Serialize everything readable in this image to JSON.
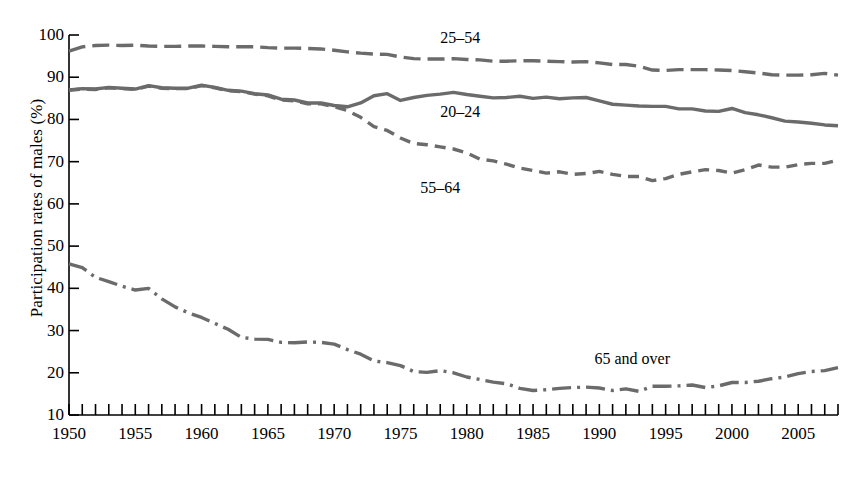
{
  "chart_data": {
    "type": "line",
    "title": "",
    "xlabel": "",
    "ylabel": "Participation rates of males (%)",
    "xlim": [
      1950,
      2008
    ],
    "ylim": [
      10,
      100
    ],
    "yticks": [
      10,
      20,
      30,
      40,
      50,
      60,
      70,
      80,
      90,
      100
    ],
    "xticks_labeled": [
      1950,
      1955,
      1960,
      1965,
      1970,
      1975,
      1980,
      1985,
      1990,
      1995,
      2000,
      2005
    ],
    "xtick_interval": 1,
    "grid": false,
    "legend_position": "inline-annotations",
    "line_color": "#6b6b6b",
    "axis_color": "#000000",
    "x": [
      1950,
      1951,
      1952,
      1953,
      1954,
      1955,
      1956,
      1957,
      1958,
      1959,
      1960,
      1961,
      1962,
      1963,
      1964,
      1965,
      1966,
      1967,
      1968,
      1969,
      1970,
      1971,
      1972,
      1973,
      1974,
      1975,
      1976,
      1977,
      1978,
      1979,
      1980,
      1981,
      1982,
      1983,
      1984,
      1985,
      1986,
      1987,
      1988,
      1989,
      1990,
      1991,
      1992,
      1993,
      1994,
      1995,
      1996,
      1997,
      1998,
      1999,
      2000,
      2001,
      2002,
      2003,
      2004,
      2005,
      2006,
      2007,
      2008
    ],
    "series": [
      {
        "name": "25-54",
        "label": "25–54",
        "dash": "long-dash",
        "label_x": 1979.5,
        "label_y": 99.0,
        "values": [
          96.2,
          97.2,
          97.5,
          97.6,
          97.5,
          97.6,
          97.4,
          97.3,
          97.3,
          97.4,
          97.4,
          97.3,
          97.2,
          97.2,
          97.2,
          97.0,
          96.9,
          96.9,
          96.8,
          96.7,
          96.4,
          96.0,
          95.7,
          95.5,
          95.4,
          94.8,
          94.4,
          94.3,
          94.3,
          94.4,
          94.2,
          94.1,
          93.8,
          93.8,
          93.9,
          93.9,
          93.8,
          93.7,
          93.6,
          93.7,
          93.4,
          93.0,
          93.0,
          92.6,
          91.7,
          91.6,
          91.8,
          91.8,
          91.8,
          91.7,
          91.6,
          91.3,
          91.0,
          90.6,
          90.5,
          90.5,
          90.6,
          90.9,
          90.5
        ]
      },
      {
        "name": "20-24",
        "label": "20–24",
        "dash": "solid",
        "label_x": 1979.5,
        "label_y": 81.5,
        "values": [
          87.0,
          87.3,
          87.2,
          87.6,
          87.4,
          87.2,
          88.0,
          87.5,
          87.4,
          87.4,
          88.1,
          87.6,
          86.9,
          86.7,
          86.1,
          85.8,
          84.8,
          84.6,
          83.9,
          83.9,
          83.3,
          83.0,
          83.9,
          85.6,
          86.1,
          84.5,
          85.2,
          85.7,
          86.0,
          86.4,
          85.9,
          85.5,
          85.1,
          85.2,
          85.5,
          85.0,
          85.3,
          84.9,
          85.1,
          85.2,
          84.4,
          83.6,
          83.4,
          83.2,
          83.1,
          83.1,
          82.5,
          82.5,
          82.0,
          81.9,
          82.6,
          81.6,
          81.1,
          80.4,
          79.6,
          79.4,
          79.1,
          78.7,
          78.5
        ]
      },
      {
        "name": "55-64",
        "label": "55–64",
        "dash": "short-dash",
        "label_x": 1978.0,
        "label_y": 63.5,
        "values": [
          86.9,
          87.2,
          87.1,
          87.5,
          87.3,
          87.1,
          87.9,
          87.4,
          87.3,
          87.3,
          88.0,
          87.5,
          86.8,
          86.6,
          86.0,
          85.6,
          84.6,
          84.4,
          83.7,
          83.7,
          83.0,
          82.1,
          80.5,
          78.3,
          77.4,
          75.6,
          74.3,
          74.0,
          73.5,
          73.0,
          72.1,
          70.6,
          70.2,
          69.4,
          68.5,
          67.9,
          67.3,
          67.6,
          67.0,
          67.2,
          67.7,
          67.0,
          66.5,
          66.5,
          65.5,
          66.0,
          67.0,
          67.6,
          68.1,
          67.9,
          67.3,
          68.1,
          69.2,
          68.7,
          68.7,
          69.3,
          69.6,
          69.6,
          70.4
        ]
      },
      {
        "name": "65 and over",
        "label": "65 and over",
        "dash": "dash-dot",
        "label_x": 1992.5,
        "label_y": 23.0,
        "values": [
          45.8,
          44.9,
          42.6,
          41.6,
          40.5,
          39.6,
          40.0,
          37.5,
          35.6,
          34.2,
          33.1,
          31.7,
          30.3,
          28.4,
          28.0,
          27.9,
          27.2,
          27.1,
          27.3,
          27.2,
          26.8,
          25.5,
          24.4,
          22.8,
          22.4,
          21.7,
          20.3,
          20.1,
          20.5,
          20.0,
          19.0,
          18.4,
          17.8,
          17.4,
          16.3,
          15.8,
          16.0,
          16.3,
          16.5,
          16.6,
          16.4,
          15.8,
          16.2,
          15.6,
          16.8,
          16.8,
          16.9,
          17.1,
          16.5,
          16.9,
          17.7,
          17.7,
          18.0,
          18.6,
          19.0,
          19.8,
          20.3,
          20.5,
          21.2
        ]
      }
    ]
  }
}
